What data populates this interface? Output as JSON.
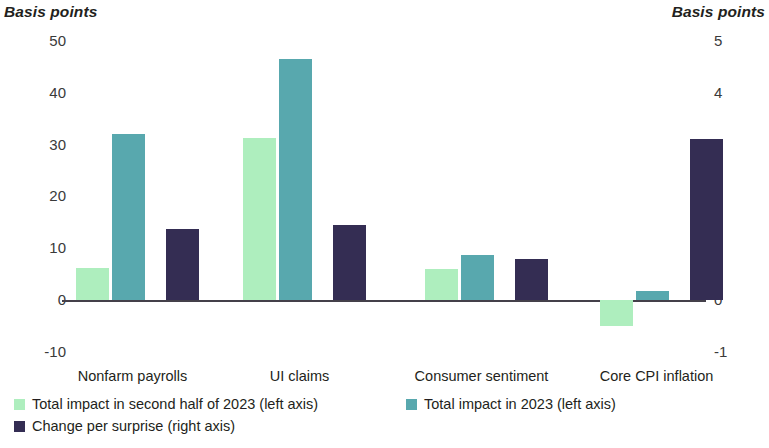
{
  "axes": {
    "left_unit": "Basis points",
    "right_unit": "Basis points",
    "left_ticks": [
      "50",
      "40",
      "30",
      "20",
      "10",
      "0",
      "-10"
    ],
    "right_ticks": [
      "5",
      "4",
      "3",
      "2",
      "1",
      "0",
      "-1"
    ]
  },
  "legend": {
    "items": [
      {
        "label": "Total impact in second half of 2023 (left axis)",
        "color": "#AEEEBE"
      },
      {
        "label": "Total impact in 2023 (left axis)",
        "color": "#58A8AE"
      },
      {
        "label": "Change per surprise (right axis)",
        "color": "#342D53"
      }
    ]
  },
  "chart_data": {
    "type": "bar",
    "title": "",
    "xlabel": "",
    "ylabel": "Basis points",
    "y2label": "Basis points",
    "categories": [
      "Nonfarm payrolls",
      "UI claims",
      "Consumer sentiment",
      "Core CPI inflation"
    ],
    "ylim": [
      -10,
      50
    ],
    "y2lim": [
      -1,
      5
    ],
    "grid": false,
    "legend_position": "bottom-left",
    "series": [
      {
        "name": "Total impact in second half of 2023 (left axis)",
        "axis": "left",
        "color": "#AEEEBE",
        "values": [
          6.2,
          31.3,
          6.0,
          -5.0
        ]
      },
      {
        "name": "Total impact in 2023 (left axis)",
        "axis": "left",
        "color": "#58A8AE",
        "values": [
          32.0,
          46.5,
          8.6,
          1.8
        ]
      },
      {
        "name": "Change per surprise (right axis)",
        "axis": "right",
        "color": "#342D53",
        "values": [
          1.37,
          1.45,
          0.79,
          3.1
        ]
      }
    ]
  }
}
